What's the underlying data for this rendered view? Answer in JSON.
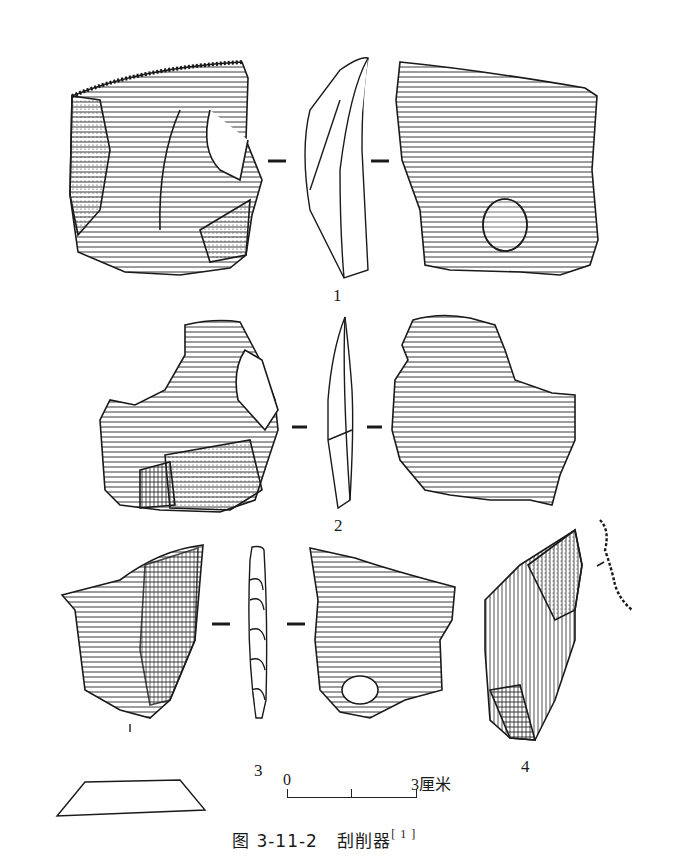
{
  "figure": {
    "caption_prefix": "图 3-11-2",
    "caption_title": "刮削器",
    "caption_ref": "[ 1 ]",
    "labels": {
      "specimen_1": "1",
      "specimen_2": "2",
      "specimen_3": "3",
      "specimen_4": "4",
      "specimen_3_section_mark": "1"
    },
    "scale_bar": {
      "start": "0",
      "end": "3厘米"
    },
    "colors": {
      "ink": "#1a1a1a",
      "background": "#ffffff"
    }
  }
}
